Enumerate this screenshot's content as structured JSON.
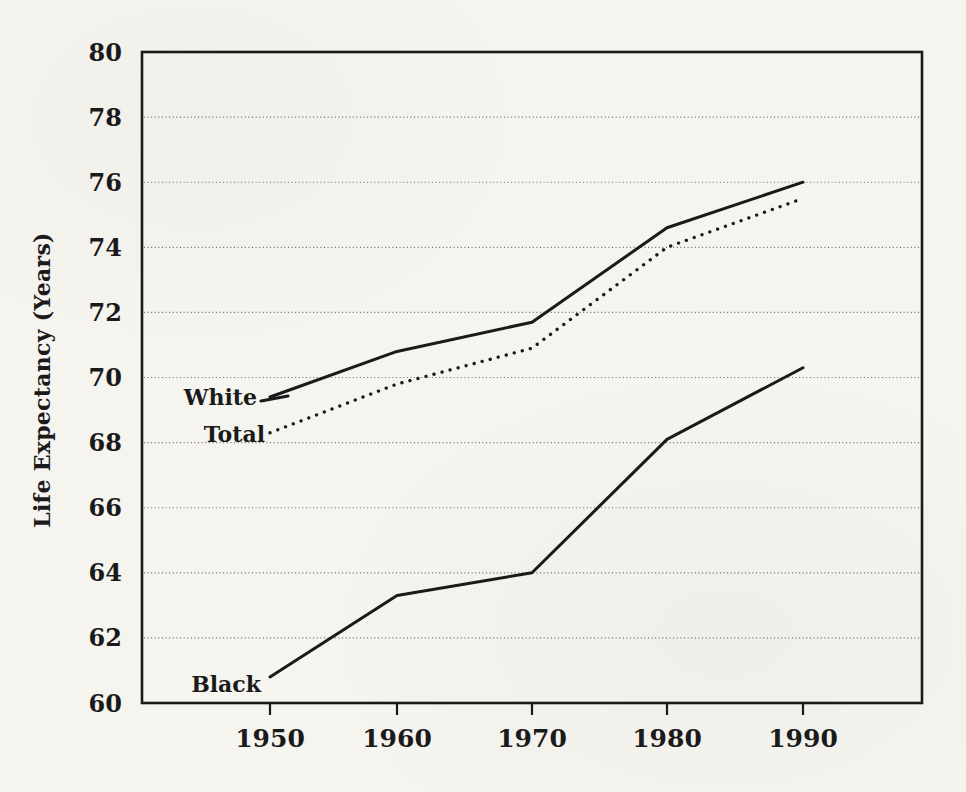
{
  "figure": {
    "paper_color": "#f5f4ef",
    "ink_color": "#1a1a1a",
    "gridline_color": "#4a4a4a"
  },
  "chart_data": {
    "type": "line",
    "title": "",
    "xlabel": "",
    "ylabel": "Life Expectancy (Years)",
    "categories": [
      "1950",
      "1960",
      "1970",
      "1980",
      "1990"
    ],
    "x_tick_labels": [
      "1950",
      "1960",
      "1970",
      "1980",
      "1990"
    ],
    "y_tick_labels": [
      "80",
      "78",
      "76",
      "74",
      "72",
      "70",
      "68",
      "66",
      "64",
      "62",
      "60"
    ],
    "ylim": [
      60,
      80
    ],
    "y_tick_step": 2,
    "grid": "horizontal-dotted",
    "legend_position": "inline-labels-left-of-first-point",
    "series": [
      {
        "name": "White",
        "style": "solid",
        "label_pointer": true,
        "values": [
          69.4,
          70.8,
          71.7,
          74.6,
          76.0
        ]
      },
      {
        "name": "Total",
        "style": "dotted",
        "label_pointer": false,
        "values": [
          68.3,
          69.8,
          70.9,
          74.0,
          75.5
        ]
      },
      {
        "name": "Black",
        "style": "solid",
        "label_pointer": false,
        "values": [
          60.8,
          63.3,
          64.0,
          68.1,
          70.3
        ]
      }
    ]
  }
}
